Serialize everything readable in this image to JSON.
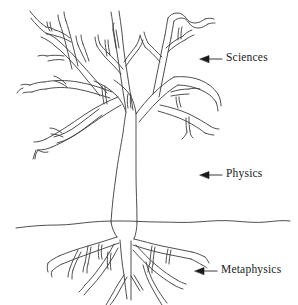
{
  "figure": {
    "background_color": "#ffffff",
    "ink_color": "#3b3b3b",
    "text_color": "#1a1a1a",
    "width": 298,
    "height": 305
  },
  "annotations": [
    {
      "id": "sciences",
      "label": "Sciences",
      "icon": "arrow-left-icon",
      "points_to": "branches",
      "arrow": {
        "x_tip": 201,
        "x_tail": 222,
        "y": 59
      },
      "label_x": 226,
      "label_y": 52
    },
    {
      "id": "physics",
      "label": "Physics",
      "icon": "arrow-left-icon",
      "points_to": "trunk",
      "arrow": {
        "x_tip": 201,
        "x_tail": 222,
        "y": 175
      },
      "label_x": 226,
      "label_y": 168
    },
    {
      "id": "metaphysics",
      "label": "Metaphysics",
      "icon": "arrow-left-icon",
      "points_to": "roots",
      "arrow": {
        "x_tip": 196,
        "x_tail": 217,
        "y": 271
      },
      "label_x": 221,
      "label_y": 264
    }
  ],
  "diagram_parts": {
    "branches_name": "tree-branches",
    "trunk_name": "tree-trunk",
    "ground_name": "ground-line",
    "roots_name": "tree-roots"
  }
}
